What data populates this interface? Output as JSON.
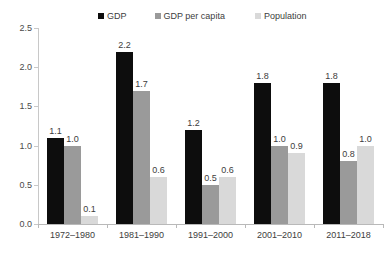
{
  "chart_data": {
    "type": "bar",
    "title": "",
    "subtitle": "",
    "xlabel": "",
    "ylabel": "",
    "ylim": [
      0,
      2.5
    ],
    "ytick_labels": [
      "0.0",
      "0.5",
      "1.0",
      "1.5",
      "2.0",
      "2.5"
    ],
    "ytick_values": [
      0,
      0.5,
      1.0,
      1.5,
      2.0,
      2.5
    ],
    "grid": false,
    "legend_position": "top",
    "categories": [
      "1972–1980",
      "1981–1990",
      "1991–2000",
      "2001–2010",
      "2011–2018"
    ],
    "series": [
      {
        "name": "GDP",
        "color": "#0d0d0d",
        "values": [
          1.1,
          2.2,
          1.2,
          1.8,
          1.8
        ],
        "labels": [
          "1.1",
          "2.2",
          "1.2",
          "1.8",
          "1.8"
        ]
      },
      {
        "name": "GDP per capita",
        "color": "#9a9a9a",
        "values": [
          1.0,
          1.7,
          0.5,
          1.0,
          0.8
        ],
        "labels": [
          "1.0",
          "1.7",
          "0.5",
          "1.0",
          "0.8"
        ]
      },
      {
        "name": "Population",
        "color": "#d9d9d9",
        "values": [
          0.1,
          0.6,
          0.6,
          0.9,
          1.0
        ],
        "labels": [
          "0.1",
          "0.6",
          "0.6",
          "0.9",
          "1.0"
        ]
      }
    ]
  },
  "legend": {
    "entries": [
      {
        "label": "GDP",
        "color": "#0d0d0d"
      },
      {
        "label": "GDP per capita",
        "color": "#9a9a9a"
      },
      {
        "label": "Population",
        "color": "#d9d9d9"
      }
    ]
  },
  "axis": {
    "y_labels": [
      "2.5",
      "2.0",
      "1.5",
      "1.0",
      "0.5",
      "0.0"
    ],
    "axis_color": "#c8c8c8"
  }
}
